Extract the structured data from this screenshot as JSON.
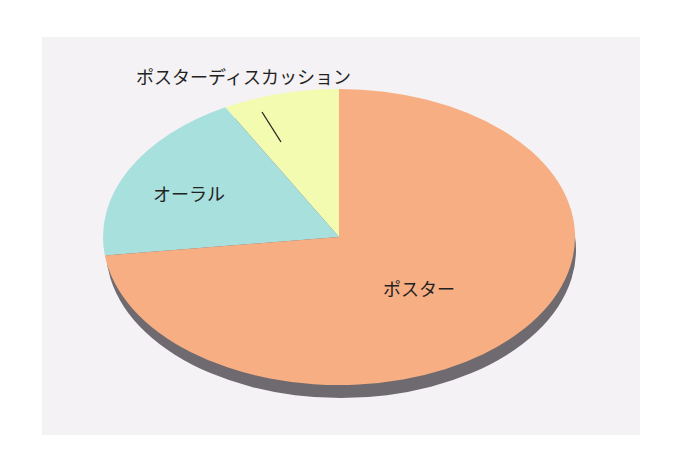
{
  "chart_data": {
    "type": "pie",
    "style": "3d-ellipse",
    "title": "",
    "categories": [
      "ポスター",
      "オーラル",
      "ポスターディスカッション"
    ],
    "values": [
      73,
      19,
      8
    ],
    "unit": "percent (estimated from slice angles)",
    "start_angle": "12 o'clock, counterclockwise for small slices",
    "colors": {
      "ポスター": "#F6AE82",
      "オーラル": "#A8E0DD",
      "ポスターディスカッション": "#F2FBB0"
    },
    "legend": "none (direct labels)",
    "annotations": [
      {
        "text": "ポスターディスカッション",
        "type": "leader-line label above slice"
      }
    ]
  },
  "labels": {
    "poster": "ポスター",
    "oral": "オーラル",
    "poster_discussion": "ポスターディスカッション"
  },
  "colors": {
    "background_panel": "#F4F2F4",
    "poster": "#F6AE82",
    "oral": "#A8E0DD",
    "poster_discussion": "#F2FBB0",
    "shadow": "#6E6A70",
    "text": "#222222"
  }
}
